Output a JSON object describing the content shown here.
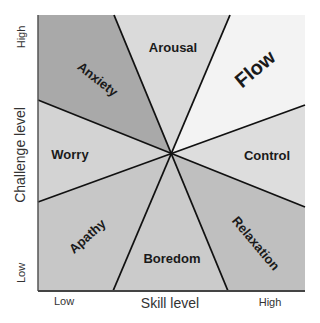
{
  "diagram": {
    "y_axis": {
      "label": "Challenge level",
      "low": "Low",
      "high": "High"
    },
    "x_axis": {
      "label": "Skill level",
      "low": "Low",
      "high": "High"
    },
    "center": {
      "x": 171,
      "y": 153
    },
    "regions": [
      {
        "id": "anxiety",
        "label": "Anxiety",
        "fill": "#a9a9a9"
      },
      {
        "id": "arousal",
        "label": "Arousal",
        "fill": "#dadada"
      },
      {
        "id": "flow",
        "label": "Flow",
        "fill": "#f3f3f3"
      },
      {
        "id": "worry",
        "label": "Worry",
        "fill": "#d3d3d3"
      },
      {
        "id": "control",
        "label": "Control",
        "fill": "#dddddd"
      },
      {
        "id": "apathy",
        "label": "Apathy",
        "fill": "#c7c7c7"
      },
      {
        "id": "boredom",
        "label": "Boredom",
        "fill": "#cbcbcb"
      },
      {
        "id": "relaxation",
        "label": "Relaxation",
        "fill": "#bfbfbf"
      }
    ],
    "line_color": "#111111",
    "frame_color": "#555555"
  }
}
